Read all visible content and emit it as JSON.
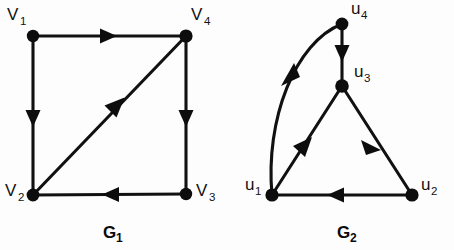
{
  "figure": {
    "title": "",
    "background_color": "#fdfdfd",
    "ink_color": "#111111"
  },
  "graphs": [
    {
      "id": "G1",
      "caption": "G",
      "caption_sub": "1",
      "caption_x": 103,
      "caption_y": 238,
      "vertices": [
        {
          "id": "V1",
          "label": "V",
          "sub": "1",
          "x": 33,
          "y": 36,
          "r": 6.2,
          "label_x": 7,
          "label_y": 20,
          "sub_x": 20,
          "sub_y": 25
        },
        {
          "id": "V4",
          "label": "V",
          "sub": "4",
          "x": 186,
          "y": 36,
          "r": 6.6,
          "label_x": 191,
          "label_y": 20,
          "sub_x": 204,
          "sub_y": 25
        },
        {
          "id": "V2",
          "label": "V",
          "sub": "2",
          "x": 33,
          "y": 195,
          "r": 6.4,
          "label_x": 5,
          "label_y": 196,
          "sub_x": 18,
          "sub_y": 201
        },
        {
          "id": "V3",
          "label": "V",
          "sub": "3",
          "x": 186,
          "y": 194,
          "r": 6.2,
          "label_x": 196,
          "label_y": 196,
          "sub_x": 209,
          "sub_y": 201
        }
      ],
      "edges": [
        {
          "from": "V1",
          "to": "V4",
          "shape": "straight",
          "direction": "right",
          "arrow_t": 0.48
        },
        {
          "from": "V1",
          "to": "V2",
          "shape": "straight",
          "direction": "down",
          "arrow_t": 0.47
        },
        {
          "from": "V4",
          "to": "V3",
          "shape": "straight",
          "direction": "down",
          "arrow_t": 0.49
        },
        {
          "from": "V3",
          "to": "V2",
          "shape": "straight",
          "direction": "left",
          "arrow_t": 0.47
        },
        {
          "from": "V2",
          "to": "V4",
          "shape": "straight",
          "direction": "up-right",
          "arrow_t": 0.55
        }
      ]
    },
    {
      "id": "G2",
      "caption": "G",
      "caption_sub": "2",
      "caption_x": 337,
      "caption_y": 238,
      "vertices": [
        {
          "id": "u4",
          "label": "u",
          "sub": "4",
          "x": 342,
          "y": 24,
          "r": 6.4,
          "label_x": 351,
          "label_y": 14,
          "sub_x": 361,
          "sub_y": 19
        },
        {
          "id": "u3",
          "label": "u",
          "sub": "3",
          "x": 342,
          "y": 86,
          "r": 6.8,
          "label_x": 354,
          "label_y": 77,
          "sub_x": 364,
          "sub_y": 82
        },
        {
          "id": "u1",
          "label": "u",
          "sub": "1",
          "x": 272,
          "y": 195,
          "r": 6.6,
          "label_x": 245,
          "label_y": 190,
          "sub_x": 255,
          "sub_y": 195
        },
        {
          "id": "u2",
          "label": "u",
          "sub": "2",
          "x": 412,
          "y": 195,
          "r": 6.6,
          "label_x": 421,
          "label_y": 190,
          "sub_x": 431,
          "sub_y": 195
        }
      ],
      "edges": [
        {
          "from": "u4",
          "to": "u1",
          "shape": "curved",
          "direction": "down-left",
          "arrow_t": 0.42
        },
        {
          "from": "u4",
          "to": "u3",
          "shape": "straight",
          "direction": "down",
          "arrow_t": 0.55
        },
        {
          "from": "u1",
          "to": "u3",
          "shape": "straight",
          "direction": "up-right",
          "arrow_t": 0.52
        },
        {
          "from": "u3",
          "to": "u2",
          "shape": "straight",
          "direction": "down-right",
          "arrow_t": 0.5
        },
        {
          "from": "u2",
          "to": "u1",
          "shape": "straight",
          "direction": "left",
          "arrow_t": 0.5
        }
      ]
    }
  ]
}
